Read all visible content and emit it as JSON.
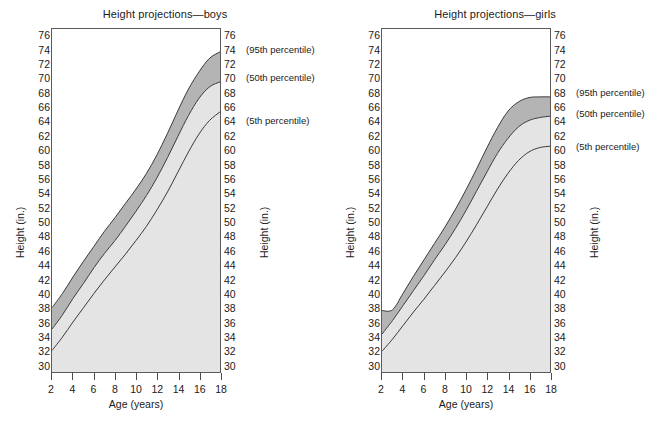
{
  "figure": {
    "axis_title_y": "Height (in.)",
    "axis_title_x": "Age (years)",
    "y_ticks": [
      76,
      74,
      72,
      70,
      68,
      66,
      64,
      62,
      60,
      58,
      56,
      54,
      52,
      50,
      48,
      46,
      44,
      42,
      40,
      38,
      36,
      34,
      32,
      30
    ],
    "x_ticks": [
      2,
      4,
      6,
      8,
      10,
      12,
      14,
      16,
      18
    ],
    "colors": {
      "band_upper": "#b4b4b4",
      "band_lower": "#e4e4e4",
      "curve": "#3a3a3a",
      "frame": "#5a5a5a",
      "text": "#1a1a1a"
    }
  },
  "chart_data": [
    {
      "type": "area",
      "title": "Height projections—boys",
      "xlabel": "Age (years)",
      "ylabel": "Height (in.)",
      "xlim": [
        2,
        18
      ],
      "ylim": [
        29,
        77
      ],
      "grid": false,
      "x": [
        2,
        3,
        4,
        5,
        6,
        7,
        8,
        9,
        10,
        11,
        12,
        13,
        14,
        15,
        16,
        17,
        18
      ],
      "series": [
        {
          "name": "95th percentile",
          "values": [
            38.0,
            40.0,
            42.3,
            44.5,
            46.6,
            48.7,
            50.6,
            52.6,
            54.6,
            56.8,
            59.4,
            62.4,
            65.6,
            68.6,
            71.0,
            72.9,
            73.8
          ],
          "annotation": "(95th percentile)",
          "annotation_y": 74
        },
        {
          "name": "50th percentile",
          "values": [
            35.0,
            37.0,
            39.3,
            41.4,
            43.6,
            45.6,
            47.4,
            49.4,
            51.5,
            53.7,
            56.2,
            59.0,
            62.0,
            64.9,
            67.3,
            68.9,
            69.6
          ],
          "annotation": "(50th percentile)",
          "annotation_y": 70
        },
        {
          "name": "5th percentile",
          "values": [
            32.0,
            33.9,
            36.0,
            38.0,
            40.0,
            41.9,
            43.7,
            45.5,
            47.4,
            49.4,
            51.7,
            54.2,
            57.0,
            59.8,
            62.3,
            64.2,
            65.4
          ],
          "annotation": "(5th percentile)",
          "annotation_y": 64
        }
      ]
    },
    {
      "type": "area",
      "title": "Height projections—girls",
      "xlabel": "Age (years)",
      "ylabel": "Height (in.)",
      "xlim": [
        2,
        18
      ],
      "ylim": [
        29,
        77
      ],
      "grid": false,
      "x": [
        2,
        3,
        4,
        5,
        6,
        7,
        8,
        9,
        10,
        11,
        12,
        13,
        14,
        15,
        16,
        17,
        18
      ],
      "series": [
        {
          "name": "95th percentile",
          "values": [
            37.6,
            37.7,
            40.0,
            42.4,
            44.7,
            47.0,
            49.3,
            51.8,
            54.5,
            57.4,
            60.4,
            63.2,
            65.5,
            66.8,
            67.4,
            67.5,
            67.5
          ],
          "annotation": "(95th percentile)",
          "annotation_y": 68
        },
        {
          "name": "50th percentile",
          "values": [
            34.3,
            36.2,
            38.3,
            40.4,
            42.5,
            44.7,
            46.8,
            49.1,
            51.6,
            54.3,
            57.0,
            59.6,
            61.7,
            63.3,
            64.2,
            64.6,
            64.8
          ],
          "annotation": "(50th percentile)",
          "annotation_y": 65
        },
        {
          "name": "5th percentile",
          "values": [
            31.9,
            33.6,
            35.5,
            37.4,
            39.2,
            41.1,
            43.0,
            45.0,
            47.2,
            49.6,
            52.1,
            54.6,
            56.8,
            58.6,
            59.8,
            60.4,
            60.6
          ],
          "annotation": "(5th percentile)",
          "annotation_y": 60.5
        }
      ]
    }
  ]
}
